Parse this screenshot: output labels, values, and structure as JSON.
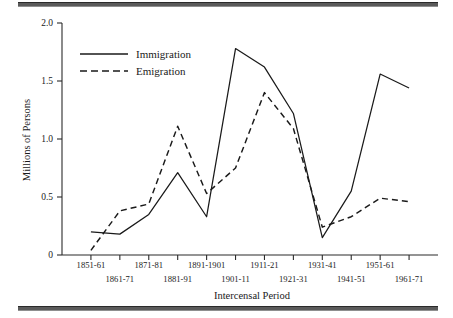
{
  "figure": {
    "has_top_rule": true,
    "has_bottom_rule": true
  },
  "chart_data": {
    "type": "line",
    "title": "",
    "xlabel": "Intercensal Period",
    "ylabel": "Millions of Persons",
    "categories": [
      "1851-61",
      "1861-71",
      "1871-81",
      "1881-91",
      "1891-1901",
      "1901-11",
      "1911-21",
      "1921-31",
      "1931-41",
      "1941-51",
      "1951-61",
      "1961-71"
    ],
    "series": [
      {
        "name": "Immigration",
        "style": "solid",
        "values": [
          0.2,
          0.18,
          0.35,
          0.71,
          0.33,
          1.78,
          1.62,
          1.22,
          0.15,
          0.55,
          1.56,
          1.44
        ]
      },
      {
        "name": "Emigration",
        "style": "dashed",
        "values": [
          0.04,
          0.38,
          0.44,
          1.11,
          0.53,
          0.75,
          1.4,
          1.09,
          0.24,
          0.33,
          0.49,
          0.46
        ]
      }
    ],
    "ylim": [
      0,
      2.0
    ],
    "yticks": [
      0,
      0.5,
      1.0,
      1.5,
      2.0
    ],
    "ytick_labels": [
      "0",
      "0.5",
      "1.0",
      "1.5",
      "2.0"
    ],
    "grid": false,
    "legend_position": "upper-left-inside"
  },
  "legend": {
    "entries": [
      {
        "label": "Immigration",
        "style": "solid"
      },
      {
        "label": "Emigration",
        "style": "dashed"
      }
    ]
  }
}
